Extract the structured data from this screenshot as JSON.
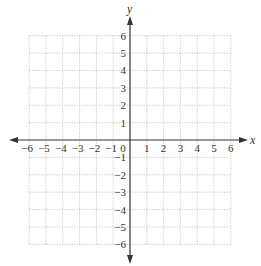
{
  "chart_data": {
    "type": "coordinate-grid",
    "title": "",
    "xlabel": "x",
    "ylabel": "y",
    "xlim": [
      -6,
      6
    ],
    "ylim": [
      -6,
      6
    ],
    "grid": true,
    "grid_style": "dotted",
    "x_ticks": [
      "−6",
      "−5",
      "−4",
      "−3",
      "−2",
      "−1",
      "0",
      "1",
      "2",
      "3",
      "4",
      "5",
      "6"
    ],
    "y_ticks": [
      "6",
      "5",
      "4",
      "3",
      "2",
      "1",
      "−1",
      "−2",
      "−3",
      "−4",
      "−5",
      "−6"
    ],
    "origin_label": "0",
    "series": []
  },
  "labels": {
    "x_axis": "x",
    "y_axis": "y",
    "origin": "0",
    "x_neg": [
      "−6",
      "−5",
      "−4",
      "−3",
      "−2",
      "−1"
    ],
    "x_pos": [
      "1",
      "2",
      "3",
      "4",
      "5",
      "6"
    ],
    "y_pos": [
      "1",
      "2",
      "3",
      "4",
      "5",
      "6"
    ],
    "y_neg": [
      "−1",
      "−2",
      "−3",
      "−4",
      "−5",
      "−6"
    ]
  },
  "colors": {
    "axis": "#333333",
    "grid": "#b0b0b0",
    "text": "#333333"
  }
}
